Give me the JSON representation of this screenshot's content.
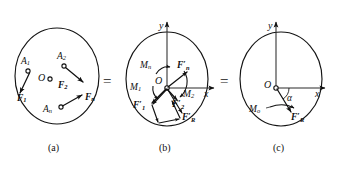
{
  "figure": {
    "equals_signs": [
      "=",
      "="
    ],
    "captions": [
      "(a)",
      "(b)",
      "(c)"
    ]
  },
  "panel_a": {
    "caption": "(a)",
    "origin_label": "O",
    "point_labels": [
      "A",
      "A",
      "A"
    ],
    "point_subs": [
      "1",
      "2",
      "n"
    ],
    "force_labels": [
      "F",
      "F",
      "F"
    ],
    "force_subs": [
      "1",
      "2",
      "n"
    ]
  },
  "panel_b": {
    "caption": "(b)",
    "origin_label": "O",
    "axis_x": "x",
    "axis_y": "y",
    "force_labels": [
      "F",
      "F",
      "F"
    ],
    "force_subs": [
      "1",
      "2",
      "n"
    ],
    "force_prime": "′",
    "moment_labels": [
      "M",
      "M",
      "M"
    ],
    "moment_subs": [
      "1",
      "2",
      "n"
    ],
    "resultant_label": "F",
    "resultant_sub": "R",
    "resultant_prime": "′"
  },
  "panel_c": {
    "caption": "(c)",
    "origin_label": "O",
    "axis_x": "x",
    "axis_y": "y",
    "angle_label": "α",
    "moment_label": "M",
    "moment_sub": "o",
    "resultant_label": "F",
    "resultant_sub": "R",
    "resultant_prime": "′"
  },
  "colors": {
    "ink": "#111111",
    "outline": "#141414",
    "axis": "#2b2b2b",
    "background": "#ffffff"
  }
}
